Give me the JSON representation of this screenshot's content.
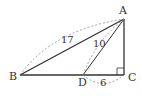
{
  "figure": {
    "type": "geometry",
    "points": {
      "A": {
        "label": "A",
        "x": 124,
        "y": 19
      },
      "B": {
        "label": "B",
        "x": 20,
        "y": 75
      },
      "C": {
        "label": "C",
        "x": 124,
        "y": 75
      },
      "D": {
        "label": "D",
        "x": 83,
        "y": 75
      }
    },
    "measures": {
      "AB": "17",
      "AD": "10",
      "DC": "6"
    },
    "right_angle_at": "C",
    "colors": {
      "line": "#333333",
      "dashed": "#888888"
    }
  }
}
